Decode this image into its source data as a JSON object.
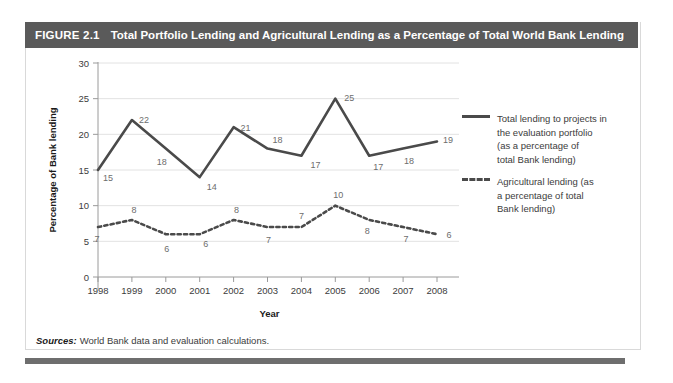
{
  "figure": {
    "number": "FIGURE 2.1",
    "title": "Total Portfolio Lending and Agricultural Lending as a Percentage of Total World Bank Lending",
    "header_bg": "#5a5a5a",
    "header_fg": "#ffffff"
  },
  "sources": {
    "label": "Sources:",
    "text": "World Bank data and evaluation calculations."
  },
  "legend": {
    "position": "right",
    "entries": [
      {
        "style": "solid",
        "lines": [
          "Total lending to projects in",
          "the evaluation portfolio",
          "(as a percentage of",
          "total Bank lending)"
        ]
      },
      {
        "style": "dashed",
        "lines": [
          "Agricultural lending (as",
          "a percentage of total",
          "Bank lending)"
        ]
      }
    ]
  },
  "chart_data": {
    "type": "line",
    "title": "Total Portfolio Lending and Agricultural Lending as a Percentage of Total World Bank Lending",
    "xlabel": "Year",
    "ylabel": "Percentage of Bank lending",
    "categories": [
      "1998",
      "1999",
      "2000",
      "2001",
      "2002",
      "2003",
      "2004",
      "2005",
      "2006",
      "2007",
      "2008"
    ],
    "ylim": [
      0,
      30
    ],
    "yticks": [
      0,
      5,
      10,
      15,
      20,
      25,
      30
    ],
    "grid": true,
    "series": [
      {
        "name": "Total lending to projects in the evaluation portfolio (as a percentage of total Bank lending)",
        "style": "solid",
        "color": "#4a4a4a",
        "values": [
          15,
          22,
          18,
          14,
          21,
          18,
          17,
          25,
          17,
          18,
          19
        ]
      },
      {
        "name": "Agricultural lending (as a percentage of total Bank lending)",
        "style": "dashed",
        "color": "#4a4a4a",
        "values": [
          7,
          8,
          6,
          6,
          8,
          7,
          7,
          10,
          8,
          7,
          6
        ]
      }
    ]
  }
}
